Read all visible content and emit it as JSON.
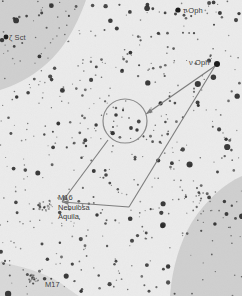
{
  "chart": {
    "type": "star-chart",
    "width": 242,
    "height": 302,
    "colors": {
      "sky_light": "#ebebeb",
      "sky_shaded": "#cfcfcf",
      "star": "#2b2b2b",
      "line": "#7a7a7a",
      "text": "#3a3a3a",
      "border": "#ffffff"
    }
  },
  "labels": [
    {
      "name": "label-tau-oph",
      "text": "τ Oph",
      "x": 183,
      "y": 6,
      "anchor": "left"
    },
    {
      "name": "label-zeta-sct",
      "text": "ζ Sct",
      "x": 9,
      "y": 33,
      "anchor": "left"
    },
    {
      "name": "label-nu-oph",
      "text": "ν Oph",
      "x": 189,
      "y": 58,
      "anchor": "left"
    },
    {
      "name": "label-m17",
      "text": "M17",
      "x": 45,
      "y": 280,
      "anchor": "left"
    }
  ],
  "nebula_label": {
    "name": "label-m16-nebulosa-aquila",
    "x": 58,
    "y": 193,
    "lines": [
      "M16",
      "Nebulosa",
      "Aquila"
    ]
  },
  "named_stars": [
    {
      "name": "star-tau-oph",
      "x": 178,
      "y": 10,
      "r": 2.6
    },
    {
      "name": "star-zeta-sct",
      "x": 6,
      "y": 37,
      "r": 2.4
    },
    {
      "name": "star-nu-oph",
      "x": 217,
      "y": 64,
      "r": 3.0
    }
  ],
  "fov_circle": {
    "name": "telescope-field-of-view-circle",
    "cx": 125,
    "cy": 121,
    "r": 22
  },
  "star_hop_path": {
    "name": "star-hop-path",
    "segments": [
      {
        "from": [
          215,
          66
        ],
        "to": [
          146,
          114
        ],
        "arrow": true
      },
      {
        "from": [
          215,
          66
        ],
        "to": [
          129,
          207
        ],
        "arrow": false
      },
      {
        "from": [
          129,
          207
        ],
        "to": [
          62,
          202
        ],
        "arrow": true
      },
      {
        "from": [
          108,
          140
        ],
        "to": [
          62,
          202
        ],
        "arrow": true
      }
    ]
  },
  "deep_sky_objects": [
    {
      "name": "cluster-m16",
      "x": 45,
      "y": 205,
      "r": 8
    },
    {
      "name": "cluster-m17",
      "x": 34,
      "y": 279,
      "r": 6
    }
  ],
  "shaded_regions": [
    {
      "name": "milky-way-shade-top-left",
      "description": "darker gray band upper-left corner"
    },
    {
      "name": "milky-way-shade-bottom-right",
      "description": "darker gray band lower-right corner"
    }
  ]
}
